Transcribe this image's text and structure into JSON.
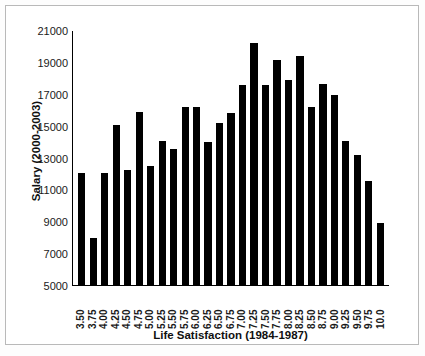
{
  "chart_data": {
    "type": "bar",
    "title": "",
    "xlabel": "Life Satisfaction (1984-1987)",
    "ylabel": "Salary (2000-2003)",
    "ylim": [
      5000,
      21000
    ],
    "yticks": [
      5000,
      7000,
      9000,
      11000,
      13000,
      15000,
      17000,
      19000,
      21000
    ],
    "ytick_labels": [
      "5000",
      "7000",
      "9000",
      "11000",
      "13000",
      "15000",
      "17000",
      "19000",
      "21000"
    ],
    "grid": false,
    "legend": null,
    "bar_color": "#000000",
    "categories": [
      "3.50",
      "3.75",
      "4.00",
      "4.25",
      "4.50",
      "4.75",
      "5.00",
      "5.25",
      "5.50",
      "5.75",
      "6.00",
      "6.25",
      "6.50",
      "6.75",
      "7.00",
      "7.25",
      "7.50",
      "7.75",
      "8.00",
      "8.25",
      "8.50",
      "8.75",
      "9.00",
      "9.25",
      "9.50",
      "9.75",
      "10.0"
    ],
    "values": [
      12000,
      7950,
      12050,
      15050,
      12200,
      15850,
      12450,
      14050,
      13550,
      16200,
      16150,
      14000,
      15150,
      15800,
      17550,
      20200,
      17550,
      19100,
      17850,
      19400,
      16150,
      17600,
      16950,
      14050,
      13150,
      11500,
      8900
    ]
  }
}
